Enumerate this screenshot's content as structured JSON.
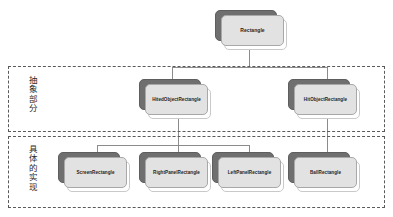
{
  "diagram": {
    "type": "class-hierarchy",
    "title": "",
    "groups": [
      {
        "id": "abstract",
        "label": "抽象部分",
        "border_style": "dashed",
        "border_color": "#5a5a5a"
      },
      {
        "id": "concrete",
        "label": "具体的实现",
        "border_style": "dashed",
        "border_color": "#5a5a5a"
      }
    ],
    "nodes": [
      {
        "id": "root",
        "label": "Rectangle",
        "group": "none"
      },
      {
        "id": "hited",
        "label": "HitedObjectRectangle",
        "group": "abstract"
      },
      {
        "id": "hit",
        "label": "HitObjectRectangle",
        "group": "abstract"
      },
      {
        "id": "screen",
        "label": "ScreenRectangle",
        "group": "concrete"
      },
      {
        "id": "rightpanel",
        "label": "RightPanelRectangle",
        "group": "concrete"
      },
      {
        "id": "leftpanel",
        "label": "LeftPanelRectangle",
        "group": "concrete"
      },
      {
        "id": "ball",
        "label": "BallRectangle",
        "group": "concrete"
      }
    ],
    "edges": [
      {
        "from": "root",
        "to": "hited"
      },
      {
        "from": "root",
        "to": "hit"
      },
      {
        "from": "hited",
        "to": "screen"
      },
      {
        "from": "hited",
        "to": "rightpanel"
      },
      {
        "from": "hited",
        "to": "leftpanel"
      },
      {
        "from": "hit",
        "to": "ball"
      }
    ],
    "colors": {
      "node_front": "#e2e2e2",
      "node_back": "#6f6f6f",
      "node_ghost": "#ffffff",
      "connector": "#8b8b8b",
      "text": "#1e1e1e",
      "background": "#ffffff"
    }
  }
}
